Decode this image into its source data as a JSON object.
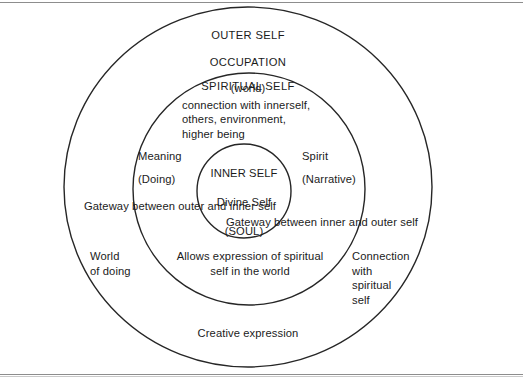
{
  "diagram": {
    "type": "concentric-circles",
    "stroke_color": "#262626",
    "background_color": "#ffffff",
    "rings": [
      {
        "name": "outer-self-ring",
        "cx": 248,
        "cy": 187,
        "rx": 184,
        "ry": 180
      },
      {
        "name": "spiritual-self-ring",
        "cx": 249,
        "cy": 189,
        "rx": 116,
        "ry": 116
      },
      {
        "name": "inner-self-ring",
        "cx": 244,
        "cy": 191,
        "rx": 47,
        "ry": 47
      }
    ],
    "outer_self": {
      "line1": "OUTER SELF",
      "line2": "OCCUPATION",
      "line3": "(world)"
    },
    "spiritual_self": {
      "title": "SPIRITUAL SELF",
      "description": "connection with innerself,\nothers, environment,\nhigher being"
    },
    "inner_self": {
      "line1": "INNER SELF",
      "line2": "Divine Self",
      "line3": "(SOUL)"
    },
    "left_axis": {
      "meaning": "Meaning",
      "doing": "(Doing)"
    },
    "right_axis": {
      "spirit": "Spirit",
      "narrative": "(Narrative)"
    },
    "gateways": {
      "outer_to_inner": "Gateway between outer and inner self",
      "inner_to_outer": "Gateway between inner and outer self"
    },
    "annotations": {
      "world_of_doing": "World\nof doing",
      "allows_expression": "Allows expression of spiritual\nself in the world",
      "connection_with_spiritual_self": "Connection\nwith\nspiritual\nself",
      "creative_expression": "Creative expression"
    }
  }
}
